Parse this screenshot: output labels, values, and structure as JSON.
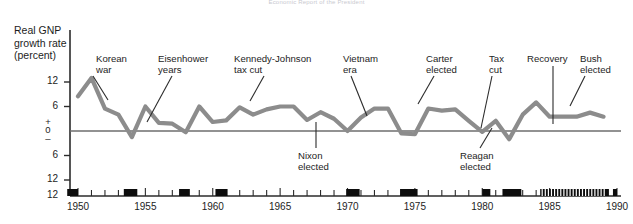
{
  "figure": {
    "source_note": "Economic Report of the President",
    "axis_title": "Real GNP\ngrowth rate\n(percent)"
  },
  "chart_data": {
    "type": "line",
    "title": "Real GNP growth rate (percent)",
    "subtitle": "Economic Report of the President",
    "xlabel": "",
    "ylabel": "Real GNP growth rate (percent)",
    "xlim": [
      1949,
      1990
    ],
    "ylim": [
      -12,
      15
    ],
    "yticks": [
      12,
      6,
      0,
      -6,
      -12
    ],
    "ytick_labels": [
      "12",
      "6",
      "0",
      "6",
      "12"
    ],
    "zero_sign_above": "+",
    "zero_sign_below": "–",
    "xticks": [
      1950,
      1955,
      1960,
      1965,
      1970,
      1975,
      1980,
      1985,
      1990
    ],
    "xtick_labels": [
      "1950",
      "1955",
      "1960",
      "1965",
      "1970",
      "1975",
      "1980",
      "1985",
      "1990"
    ],
    "grid": false,
    "legend": "none",
    "series": [
      {
        "name": "Real GNP growth rate",
        "color": "#8c8c8c",
        "x": [
          1950,
          1951,
          1952,
          1953,
          1954,
          1955,
          1956,
          1957,
          1958,
          1959,
          1960,
          1961,
          1962,
          1963,
          1964,
          1965,
          1966,
          1967,
          1968,
          1969,
          1970,
          1971,
          1972,
          1973,
          1974,
          1975,
          1976,
          1977,
          1978,
          1979,
          1980,
          1981,
          1982,
          1983,
          1984,
          1985,
          1986,
          1987,
          1988,
          1989
        ],
        "values": [
          8.5,
          13.0,
          5.5,
          4.0,
          -1.5,
          6.0,
          2.0,
          1.8,
          -0.3,
          6.0,
          2.2,
          2.6,
          5.8,
          4.0,
          5.3,
          6.0,
          6.0,
          2.7,
          4.6,
          3.0,
          0.0,
          3.3,
          5.5,
          5.5,
          -0.6,
          -0.8,
          5.5,
          5.0,
          5.3,
          2.5,
          -0.2,
          2.5,
          -2.0,
          4.0,
          7.0,
          3.5,
          3.5,
          3.5,
          4.5,
          3.5
        ]
      }
    ],
    "recession_bars": [
      {
        "start": 1949.2,
        "end": 1950.0
      },
      {
        "start": 1953.4,
        "end": 1954.4
      },
      {
        "start": 1957.5,
        "end": 1958.3
      },
      {
        "start": 1960.2,
        "end": 1961.1
      },
      {
        "start": 1969.9,
        "end": 1970.9
      },
      {
        "start": 1973.9,
        "end": 1975.2
      },
      {
        "start": 1980.0,
        "end": 1980.6
      },
      {
        "start": 1981.5,
        "end": 1982.9
      },
      {
        "start": 1984.3,
        "end": 1989.4
      },
      {
        "start": 1989.7,
        "end": 1990.0
      }
    ],
    "annotations": [
      {
        "label": "Korean\nwar",
        "position": "above",
        "x_text": 96,
        "y_text": 53,
        "leader": [
          [
            93,
            76
          ],
          [
            108,
            100
          ]
        ]
      },
      {
        "label": "Eisenhower\nyears",
        "position": "above",
        "x_text": 158,
        "y_text": 53,
        "leader": [
          [
            172,
            76
          ],
          [
            147,
            122
          ]
        ]
      },
      {
        "label": "Kennedy-Johnson\ntax cut",
        "position": "above",
        "x_text": 234,
        "y_text": 53,
        "leader": [
          [
            264,
            76
          ],
          [
            250,
            101
          ]
        ]
      },
      {
        "label": "Vietnam\nera",
        "position": "above",
        "x_text": 343,
        "y_text": 53,
        "leader": [
          [
            351,
            76
          ],
          [
            367,
            116
          ]
        ]
      },
      {
        "label": "Carter\nelected",
        "position": "above",
        "x_text": 426,
        "y_text": 53,
        "leader": [
          [
            434,
            76
          ],
          [
            418,
            104
          ]
        ]
      },
      {
        "label": "Tax\ncut",
        "position": "above",
        "x_text": 489,
        "y_text": 53,
        "leader": [
          [
            492,
            76
          ],
          [
            481,
            128
          ]
        ]
      },
      {
        "label": "Recovery",
        "position": "above",
        "x_text": 527,
        "y_text": 53,
        "leader": [
          [
            553,
            66
          ],
          [
            553,
            124
          ]
        ]
      },
      {
        "label": "Bush\nelected",
        "position": "above",
        "x_text": 580,
        "y_text": 53,
        "leader": [
          [
            585,
            76
          ],
          [
            570,
            106
          ]
        ]
      },
      {
        "label": "Nixon\nelected",
        "position": "below",
        "x_text": 298,
        "y_text": 150,
        "leader": [
          [
            316,
            148
          ],
          [
            316,
            122
          ]
        ]
      },
      {
        "label": "Reagan\nelected",
        "position": "below",
        "x_text": 460,
        "y_text": 150,
        "leader": [
          [
            480,
            148
          ],
          [
            492,
            128
          ]
        ]
      }
    ]
  }
}
